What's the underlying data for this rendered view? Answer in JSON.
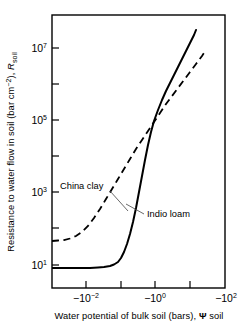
{
  "chart_data": {
    "type": "line",
    "title": "",
    "xlabel": "Water  potential of bulk soil (bars), Ψ soil",
    "ylabel": "Resistance to water flow in soil (bar cm−2), R soil",
    "ylabel_parts": {
      "main": "Resistance to water flow in soil (bar cm",
      "exponent": "−2",
      "after": "), ",
      "symbol": "R",
      "subscript": "soil"
    },
    "xlabel_parts": {
      "main": "Water  potential of bulk soil (bars), ",
      "symbol": "Ψ",
      "after": " soil"
    },
    "xscale": "log-negative",
    "yscale": "log",
    "xlim": [
      -0.001,
      -100.0
    ],
    "ylim": [
      1,
      100000000
    ],
    "grid": false,
    "legend_position": "inline-annotations",
    "xticks": [
      {
        "value": "",
        "label": "",
        "x_px": 52
      },
      {
        "value": "-10^-2",
        "label": "−10",
        "exponent": "−2",
        "x_px": 86
      },
      {
        "value": "",
        "label": "",
        "x_px": 121
      },
      {
        "value": "-10^0",
        "label": "−10",
        "exponent": "0",
        "x_px": 155
      },
      {
        "value": "",
        "label": "",
        "x_px": 190
      },
      {
        "value": "-10^2",
        "label": "−10",
        "exponent": "2",
        "x_px": 225
      }
    ],
    "yticks": [
      {
        "value": "10^7",
        "label": "10",
        "exponent": "7",
        "y_px": 48
      },
      {
        "value": "",
        "label": "",
        "y_px": 84
      },
      {
        "value": "10^5",
        "label": "10",
        "exponent": "5",
        "y_px": 120
      },
      {
        "value": "",
        "label": "",
        "y_px": 156
      },
      {
        "value": "10^3",
        "label": "10",
        "exponent": "3",
        "y_px": 192
      },
      {
        "value": "",
        "label": "",
        "y_px": 228
      },
      {
        "value": "10^1",
        "label": "10",
        "exponent": "1",
        "y_px": 265
      }
    ],
    "series": [
      {
        "name": "China clay",
        "style": "dashed",
        "color": "#000000",
        "annotation": "China clay",
        "points": [
          [
            52,
            241
          ],
          [
            58,
            240.5
          ],
          [
            64,
            240
          ],
          [
            70,
            238.5
          ],
          [
            76,
            236
          ],
          [
            82,
            232
          ],
          [
            88,
            226
          ],
          [
            94,
            218
          ],
          [
            100,
            209
          ],
          [
            106,
            199
          ],
          [
            112,
            189
          ],
          [
            118,
            179
          ],
          [
            124,
            169
          ],
          [
            130,
            159
          ],
          [
            136,
            149
          ],
          [
            142,
            140
          ],
          [
            148,
            131
          ],
          [
            154,
            122
          ],
          [
            160,
            113
          ],
          [
            166,
            104
          ],
          [
            172,
            96
          ],
          [
            178,
            88
          ],
          [
            184,
            80
          ],
          [
            190,
            72
          ],
          [
            196,
            64
          ],
          [
            202,
            56
          ],
          [
            206,
            50
          ]
        ]
      },
      {
        "name": "Indio loam",
        "style": "solid",
        "color": "#000000",
        "annotation": "Indio loam",
        "points": [
          [
            52,
            268
          ],
          [
            60,
            268
          ],
          [
            70,
            268
          ],
          [
            80,
            268
          ],
          [
            90,
            268
          ],
          [
            98,
            267.5
          ],
          [
            104,
            267
          ],
          [
            110,
            266
          ],
          [
            114,
            264.5
          ],
          [
            118,
            262
          ],
          [
            121,
            258
          ],
          [
            124,
            252
          ],
          [
            127,
            244
          ],
          [
            130,
            234
          ],
          [
            133,
            222
          ],
          [
            136,
            208
          ],
          [
            139,
            192
          ],
          [
            142,
            176
          ],
          [
            145,
            160
          ],
          [
            148,
            145
          ],
          [
            151,
            132
          ],
          [
            154,
            121
          ],
          [
            158,
            110
          ],
          [
            162,
            100
          ],
          [
            166,
            91
          ],
          [
            170,
            83
          ],
          [
            174,
            75
          ],
          [
            178,
            67
          ],
          [
            182,
            59
          ],
          [
            186,
            51
          ],
          [
            190,
            43
          ],
          [
            194,
            35
          ],
          [
            196,
            30
          ]
        ]
      }
    ],
    "annotations": [
      {
        "text": "China clay",
        "text_x": 60,
        "text_y": 189,
        "leader": [
          [
            112,
            190
          ],
          [
            127,
            209
          ]
        ]
      },
      {
        "text": "Indio loam",
        "text_x": 146,
        "text_y": 216,
        "leader": [
          [
            144,
            213
          ],
          [
            127,
            203
          ]
        ]
      }
    ],
    "plot_box": {
      "left": 52,
      "top": 15,
      "right": 225,
      "bottom": 288
    }
  }
}
